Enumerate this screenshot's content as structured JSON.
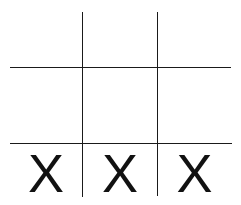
{
  "board": {
    "rows": [
      [
        "",
        "",
        ""
      ],
      [
        "",
        "",
        ""
      ],
      [
        "X",
        "X",
        "X"
      ]
    ]
  }
}
